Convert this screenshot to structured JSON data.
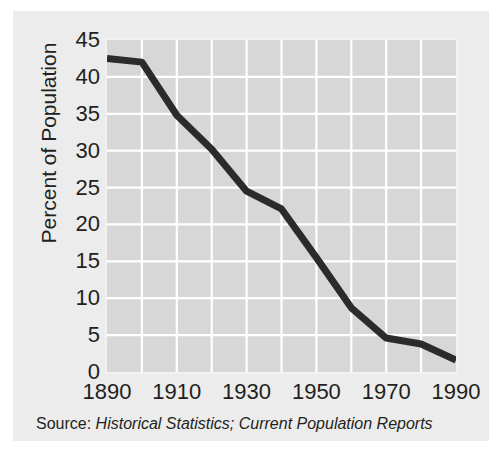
{
  "figure": {
    "background_color": "#ececec",
    "page_color": "#ffffff"
  },
  "source_note": {
    "label": "Source:",
    "titles": "Historical Statistics; Current Population Reports",
    "full_text": "Source: Historical Statistics; Current Population Reports"
  },
  "axes": {
    "y_title": "Percent of Population",
    "y_ticks": [
      "0",
      "5",
      "10",
      "15",
      "20",
      "25",
      "30",
      "35",
      "40",
      "45"
    ],
    "x_ticks": [
      "1890",
      "1910",
      "1930",
      "1950",
      "1970",
      "1990"
    ]
  },
  "chart_data": {
    "type": "line",
    "title": "",
    "subtitle": "",
    "xlabel": "",
    "ylabel": "Percent of Population",
    "xlim": [
      1890,
      1990
    ],
    "ylim": [
      0,
      45
    ],
    "x_tick_values": [
      1890,
      1910,
      1930,
      1950,
      1970,
      1990
    ],
    "y_tick_values": [
      0,
      5,
      10,
      15,
      20,
      25,
      30,
      35,
      40,
      45
    ],
    "x_minor_gridline_step": 10,
    "y_gridline_step": 5,
    "grid": true,
    "grid_color": "#ffffff",
    "plot_background": "#d7d7d7",
    "legend": false,
    "legend_position": "none",
    "annotations": [],
    "series": [
      {
        "name": "Percent of Population",
        "color": "#2b2b2b",
        "line_width": 7,
        "x": [
          1890,
          1900,
          1910,
          1920,
          1930,
          1940,
          1950,
          1960,
          1970,
          1980,
          1990
        ],
        "values": [
          42.5,
          42.0,
          34.8,
          30.2,
          24.5,
          22.1,
          15.5,
          8.7,
          4.6,
          3.8,
          1.6
        ]
      }
    ]
  }
}
